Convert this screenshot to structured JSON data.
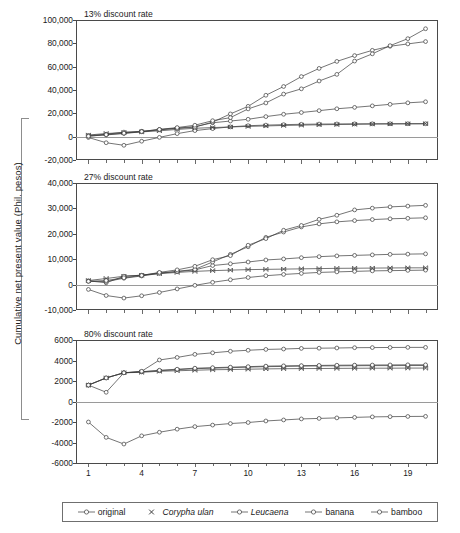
{
  "figure": {
    "y_axis_label": "Cumulative net present value (Phil. pesos)"
  },
  "legend": {
    "items": [
      {
        "label": "original",
        "marker": "circle",
        "italic": false
      },
      {
        "label": "Corypha ulan",
        "marker": "x",
        "italic": true
      },
      {
        "label": "Leucaena",
        "marker": "circle",
        "italic": true
      },
      {
        "label": "banana",
        "marker": "circle",
        "italic": false
      },
      {
        "label": "bamboo",
        "marker": "circle",
        "italic": false
      }
    ]
  },
  "chart_data": [
    {
      "type": "line",
      "title": "13% discount rate",
      "xlabel": "",
      "ylabel": "Cumulative net present value (Phil. pesos)",
      "xlim": [
        0.3,
        20.7
      ],
      "ylim": [
        -20000,
        100000
      ],
      "yticks": [
        -20000,
        0,
        20000,
        40000,
        60000,
        80000,
        100000
      ],
      "ytick_labels": [
        "-20,000",
        "0",
        "20,000",
        "40,000",
        "60,000",
        "80,000",
        "100,000"
      ],
      "xticks": [
        1,
        4,
        7,
        10,
        13,
        16,
        19
      ],
      "xtick_labels": [
        "1",
        "4",
        "7",
        "10",
        "13",
        "16",
        "19"
      ],
      "grid": false,
      "legend_position": "bottom",
      "x": [
        1,
        2,
        3,
        4,
        5,
        6,
        7,
        8,
        9,
        10,
        11,
        12,
        13,
        14,
        15,
        16,
        17,
        18,
        19,
        20
      ],
      "series": [
        {
          "name": "original",
          "marker": "circle",
          "values": [
            -700,
            -5200,
            -7400,
            -3900,
            -600,
            2600,
            5200,
            6900,
            8400,
            9400,
            9900,
            10300,
            10600,
            10800,
            10900,
            11000,
            11050,
            11100,
            11100,
            11100
          ]
        },
        {
          "name": "Corypha ulan",
          "marker": "x",
          "values": [
            1400,
            2700,
            3500,
            4100,
            5000,
            6200,
            7200,
            7800,
            8300,
            8800,
            9200,
            9600,
            9900,
            10200,
            10400,
            10600,
            10800,
            10900,
            11000,
            11100
          ]
        },
        {
          "name": "Leucaena",
          "marker": "circle",
          "values": [
            900,
            2100,
            3900,
            4600,
            6100,
            7300,
            8600,
            11900,
            13400,
            14900,
            17200,
            19200,
            20700,
            22300,
            23900,
            25100,
            26400,
            27700,
            29000,
            29900
          ]
        },
        {
          "name": "banana",
          "marker": "circle",
          "values": [
            500,
            1500,
            2700,
            4200,
            5900,
            7000,
            8200,
            12500,
            19500,
            26000,
            35500,
            43000,
            51500,
            58500,
            64500,
            69500,
            74000,
            77500,
            79500,
            81500
          ]
        },
        {
          "name": "bamboo",
          "marker": "circle",
          "values": [
            400,
            1700,
            3000,
            4400,
            6200,
            7800,
            9800,
            13700,
            16300,
            23800,
            28900,
            36500,
            41000,
            47700,
            53400,
            64800,
            71000,
            78000,
            84000,
            92500
          ]
        }
      ]
    },
    {
      "type": "line",
      "title": "27% discount rate",
      "xlabel": "",
      "ylabel": "Cumulative net present value (Phil. pesos)",
      "xlim": [
        0.3,
        20.7
      ],
      "ylim": [
        -10000,
        40000
      ],
      "yticks": [
        -10000,
        0,
        10000,
        20000,
        30000,
        40000
      ],
      "ytick_labels": [
        "-10,000",
        "0",
        "10,000",
        "20,000",
        "30,000",
        "40,000"
      ],
      "xticks": [
        1,
        4,
        7,
        10,
        13,
        16,
        19
      ],
      "xtick_labels": [
        "1",
        "4",
        "7",
        "10",
        "13",
        "16",
        "19"
      ],
      "grid": false,
      "legend_position": "bottom",
      "x": [
        1,
        2,
        3,
        4,
        5,
        6,
        7,
        8,
        9,
        10,
        11,
        12,
        13,
        14,
        15,
        16,
        17,
        18,
        19,
        20
      ],
      "series": [
        {
          "name": "original",
          "marker": "circle",
          "values": [
            -1900,
            -4300,
            -5300,
            -4400,
            -3100,
            -1700,
            -300,
            900,
            1900,
            2800,
            3500,
            4000,
            4400,
            4800,
            5000,
            5200,
            5400,
            5500,
            5600,
            5700
          ]
        },
        {
          "name": "Corypha ulan",
          "marker": "x",
          "values": [
            1600,
            2400,
            3300,
            3700,
            4300,
            4800,
            5200,
            5500,
            5700,
            5900,
            6000,
            6100,
            6200,
            6300,
            6400,
            6450,
            6500,
            6550,
            6600,
            6600
          ]
        },
        {
          "name": "Leucaena",
          "marker": "circle",
          "values": [
            1500,
            700,
            3300,
            3700,
            4600,
            5100,
            5800,
            7500,
            8200,
            8900,
            9700,
            10100,
            10600,
            11000,
            11300,
            11500,
            11700,
            11900,
            12000,
            12100
          ]
        },
        {
          "name": "banana",
          "marker": "circle",
          "values": [
            1300,
            1200,
            2500,
            3400,
            4400,
            5200,
            6000,
            8900,
            11900,
            14900,
            18600,
            20700,
            22700,
            23900,
            24700,
            25200,
            25600,
            25900,
            26100,
            26300
          ]
        },
        {
          "name": "bamboo",
          "marker": "circle",
          "values": [
            1300,
            1600,
            2700,
            3600,
            4800,
            5800,
            7200,
            9800,
            11400,
            15500,
            18100,
            21400,
            23300,
            25700,
            27300,
            29400,
            30100,
            30600,
            30900,
            31200
          ]
        }
      ]
    },
    {
      "type": "line",
      "title": "80% discount rate",
      "xlabel": "",
      "ylabel": "Cumulative net present value (Phil. pesos)",
      "xlim": [
        0.3,
        20.7
      ],
      "ylim": [
        -6000,
        6000
      ],
      "yticks": [
        -6000,
        -4000,
        -2000,
        0,
        2000,
        4000,
        6000
      ],
      "ytick_labels": [
        "-6000",
        "-4000",
        "-2000",
        "0",
        "2000",
        "4000",
        "6000"
      ],
      "xticks": [
        1,
        4,
        7,
        10,
        13,
        16,
        19
      ],
      "xtick_labels": [
        "1",
        "4",
        "7",
        "10",
        "13",
        "16",
        "19"
      ],
      "grid": false,
      "legend_position": "bottom",
      "x": [
        1,
        2,
        3,
        4,
        5,
        6,
        7,
        8,
        9,
        10,
        11,
        12,
        13,
        14,
        15,
        16,
        17,
        18,
        19,
        20
      ],
      "series": [
        {
          "name": "original",
          "marker": "circle",
          "values": [
            -2000,
            -3500,
            -4150,
            -3350,
            -3000,
            -2700,
            -2450,
            -2300,
            -2150,
            -2050,
            -1900,
            -1800,
            -1700,
            -1650,
            -1600,
            -1550,
            -1500,
            -1480,
            -1460,
            -1450
          ]
        },
        {
          "name": "Corypha ulan",
          "marker": "x",
          "values": [
            1600,
            2300,
            2800,
            2850,
            2950,
            3000,
            3050,
            3100,
            3120,
            3150,
            3180,
            3200,
            3210,
            3220,
            3230,
            3240,
            3250,
            3250,
            3260,
            3260
          ]
        },
        {
          "name": "Leucaena",
          "marker": "circle",
          "values": [
            1600,
            900,
            2800,
            2900,
            3000,
            3100,
            3200,
            3250,
            3300,
            3350,
            3400,
            3420,
            3450,
            3470,
            3480,
            3490,
            3500,
            3500,
            3510,
            3510
          ]
        },
        {
          "name": "banana",
          "marker": "circle",
          "values": [
            1600,
            2300,
            2800,
            2900,
            3050,
            3150,
            3250,
            3300,
            3350,
            3400,
            3450,
            3480,
            3500,
            3520,
            3540,
            3550,
            3560,
            3570,
            3580,
            3580
          ]
        },
        {
          "name": "bamboo",
          "marker": "circle",
          "values": [
            1600,
            2300,
            2800,
            2950,
            4050,
            4300,
            4600,
            4750,
            4900,
            5000,
            5080,
            5120,
            5180,
            5200,
            5220,
            5250,
            5260,
            5270,
            5280,
            5280
          ]
        }
      ]
    }
  ]
}
